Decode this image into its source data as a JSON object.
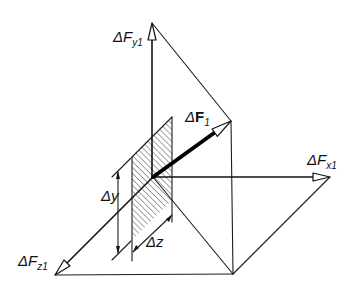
{
  "figure": {
    "type": "force-component-diagram",
    "labels": {
      "fy1": {
        "main": "ΔF",
        "sub": "y1"
      },
      "f1": {
        "delta": "Δ",
        "main": "F",
        "sub": "1"
      },
      "fx1": {
        "main": "ΔF",
        "sub": "x1"
      },
      "fz1": {
        "main": "ΔF",
        "sub": "z1"
      },
      "dy": "Δy",
      "dz": "Δz"
    },
    "colors": {
      "line": "#1c1c1c",
      "background": "#ffffff"
    }
  }
}
